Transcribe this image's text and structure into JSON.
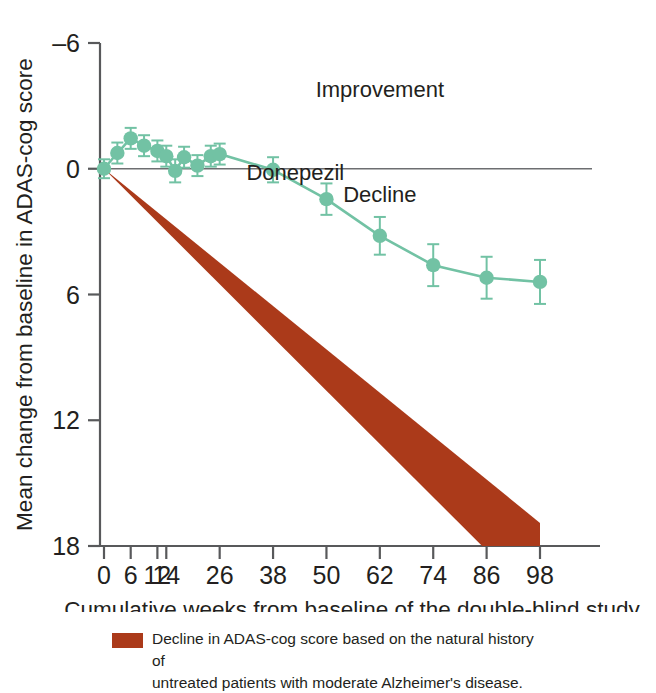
{
  "chart_data": {
    "type": "line",
    "title": "",
    "xlabel": "Cumulative weeks from baseline of the double-blind study",
    "ylabel": "Mean change from baseline in ADAS-cog score",
    "y_inverted": true,
    "ylim": [
      -6,
      18
    ],
    "yticks": [
      -6,
      0,
      6,
      12,
      18
    ],
    "ytick_labels": [
      "–6",
      "0",
      "6",
      "12",
      "18"
    ],
    "xlim": [
      -1,
      103
    ],
    "xticks": [
      0,
      6,
      12,
      14,
      26,
      38,
      50,
      62,
      74,
      86,
      98
    ],
    "xtick_labels": [
      "0",
      "6",
      "12",
      "14",
      "26",
      "38",
      "50",
      "62",
      "74",
      "86",
      "98"
    ],
    "grid": false,
    "legend_position": "inline-label",
    "annotations": [
      {
        "text": "Improvement",
        "x": 62,
        "y": -3.4
      },
      {
        "text": "Decline",
        "x": 62,
        "y": 1.6
      },
      {
        "text": "Donepezil",
        "x": 43,
        "y": 0.55
      }
    ],
    "zero_line": 0,
    "series": [
      {
        "name": "Donepezil",
        "color": "#72c2a4",
        "marker": "circle",
        "x": [
          0,
          3,
          6,
          9,
          12,
          14,
          16,
          18,
          21,
          24,
          26,
          38,
          50,
          62,
          74,
          86,
          98
        ],
        "values": [
          0.0,
          -0.75,
          -1.45,
          -1.1,
          -0.85,
          -0.6,
          0.1,
          -0.55,
          -0.15,
          -0.6,
          -0.7,
          0.05,
          1.45,
          3.2,
          4.6,
          5.2,
          5.4
        ],
        "errors": [
          0.45,
          0.5,
          0.5,
          0.5,
          0.5,
          0.5,
          0.55,
          0.5,
          0.5,
          0.5,
          0.5,
          0.6,
          0.75,
          0.9,
          1.0,
          1.0,
          1.05
        ]
      }
    ],
    "band": {
      "name": "Decline in ADAS-cog score based on the natural history of untreated patients with moderate Alzheimer's disease.",
      "color": "#ab3a1a",
      "apex": {
        "x": 0,
        "y": 0
      },
      "upper_edge_end": {
        "x": 98,
        "y": 16.9
      },
      "lower_edge_end": {
        "x": 85,
        "y": 18.0
      }
    }
  },
  "caption": {
    "swatch_color": "#ab3a1a",
    "line1": "Decline in ADAS-cog score based on the natural history of",
    "line2": "untreated patients with moderate Alzheimer's disease."
  },
  "colors": {
    "series_green": "#72c2a4",
    "label_green": "#93d2b6",
    "band_red": "#ab3a1a",
    "axis": "#58595b",
    "text": "#231f20"
  }
}
